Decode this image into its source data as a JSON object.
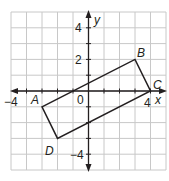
{
  "diagram": {
    "type": "coordinate-plane",
    "x_range": [
      -5,
      5
    ],
    "y_range": [
      -5,
      5
    ],
    "axis_labels": {
      "x": "x",
      "y": "y"
    },
    "tick_labels": {
      "x_neg4": "−4",
      "x_pos4": "4",
      "origin": "0",
      "y_pos4": "4",
      "y_pos2": "2",
      "y_neg4": "−4"
    },
    "vertices": [
      {
        "name": "A",
        "x": -3,
        "y": -1
      },
      {
        "name": "B",
        "x": 3,
        "y": 2
      },
      {
        "name": "C",
        "x": 4,
        "y": 0
      },
      {
        "name": "D",
        "x": -2,
        "y": -3
      }
    ],
    "polygon": "ABCD",
    "colors": {
      "grid": "#c8c8c8",
      "lines": "#231f20",
      "background": "#ffffff"
    }
  }
}
